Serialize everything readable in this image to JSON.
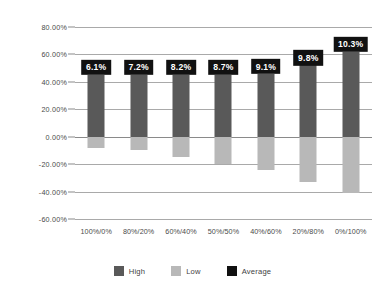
{
  "chart_data": {
    "type": "bar",
    "title": "",
    "subtitle": "",
    "xlabel": "",
    "ylabel": "",
    "ylim": [
      -60,
      80
    ],
    "ytick_step": 20,
    "grid": true,
    "legend_position": "bottom",
    "categories": [
      "100%/0%",
      "80%/20%",
      "60%/40%",
      "50%/50%",
      "40%/60%",
      "20%/80%",
      "0%/100%"
    ],
    "ytick_labels": [
      "80.00%",
      "60.00%",
      "40.00%",
      "20.00%",
      "0.00%",
      "-20.00%",
      "-40.00%",
      "-60.00%"
    ],
    "ytick_values": [
      80,
      60,
      40,
      20,
      0,
      -20,
      -40,
      -60
    ],
    "series": [
      {
        "name": "High",
        "color": "#595959",
        "values": [
          45.0,
          45.0,
          45.0,
          45.0,
          45.5,
          52.0,
          62.0
        ]
      },
      {
        "name": "Low",
        "color": "#b8b8b8",
        "values": [
          -8.0,
          -10.0,
          -15.0,
          -20.0,
          -24.0,
          -33.0,
          -41.0
        ]
      },
      {
        "name": "Average",
        "color": "#111111",
        "values": [
          6.1,
          7.2,
          8.2,
          8.7,
          9.1,
          9.8,
          10.3
        ],
        "labels": [
          "6.1%",
          "7.2%",
          "8.2%",
          "8.7%",
          "9.1%",
          "9.8%",
          "10.3%"
        ]
      }
    ]
  },
  "legend": {
    "items": [
      {
        "label": "High",
        "color": "#595959"
      },
      {
        "label": "Low",
        "color": "#b8b8b8"
      },
      {
        "label": "Average",
        "color": "#111111"
      }
    ]
  }
}
